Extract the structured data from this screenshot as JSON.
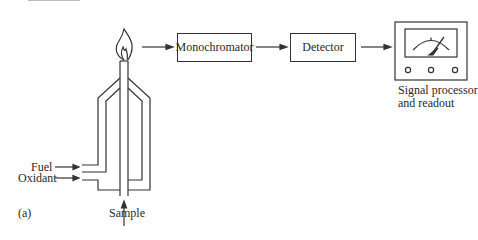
{
  "diagram": {
    "panel_label": "(a)",
    "inputs": {
      "fuel": "Fuel",
      "oxidant": "Oxidant",
      "sample": "Sample"
    },
    "components": [
      {
        "id": "burner",
        "label": ""
      },
      {
        "id": "monochromator",
        "label": "Monochromator"
      },
      {
        "id": "detector",
        "label": "Detector"
      },
      {
        "id": "readout",
        "label_line1": "Signal processor",
        "label_line2": "and readout"
      }
    ],
    "flow": [
      "burner flame",
      "Monochromator",
      "Detector",
      "Signal processor and readout"
    ],
    "colors": {
      "stroke": "#333333",
      "background": "#ffffff"
    }
  }
}
